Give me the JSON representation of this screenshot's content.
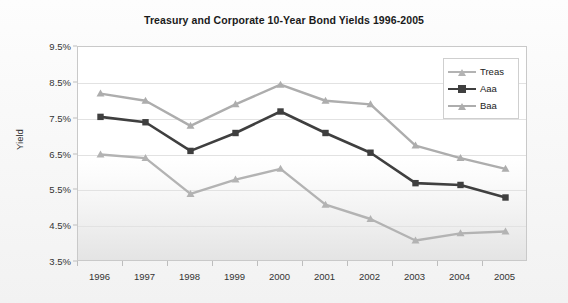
{
  "chart_data": {
    "type": "line",
    "title": "Treasury and Corporate 10-Year Bond Yields 1996-2005",
    "xlabel": "",
    "ylabel": "Yield",
    "categories": [
      "1996",
      "1997",
      "1998",
      "1999",
      "2000",
      "2001",
      "2002",
      "2003",
      "2004",
      "2005"
    ],
    "ylim": [
      3.5,
      9.5
    ],
    "ytick_labels": [
      "9.5%",
      "8.5%",
      "7.5%",
      "6.5%",
      "5.5%",
      "4.5%",
      "3.5%"
    ],
    "ytick_values": [
      9.5,
      8.5,
      7.5,
      6.5,
      5.5,
      4.5,
      3.5
    ],
    "grid": true,
    "legend_position": "top-right",
    "series": [
      {
        "name": "Treas",
        "color": "#b3b3b3",
        "marker": "triangle",
        "values": [
          6.5,
          6.4,
          5.4,
          5.8,
          6.1,
          5.1,
          4.7,
          4.1,
          4.3,
          4.35
        ]
      },
      {
        "name": "Aaa",
        "color": "#3f3f3f",
        "marker": "square",
        "values": [
          7.55,
          7.4,
          6.6,
          7.1,
          7.7,
          7.1,
          6.55,
          5.7,
          5.65,
          5.3
        ]
      },
      {
        "name": "Baa",
        "color": "#adadad",
        "marker": "triangle",
        "values": [
          8.2,
          8.0,
          7.3,
          7.9,
          8.45,
          8.0,
          7.9,
          6.75,
          6.4,
          6.1
        ]
      }
    ]
  },
  "colors": {
    "plot_border": "#c9c9c9",
    "gridline": "#e2e2e2",
    "text": "#333333",
    "title_text": "#1a1a1a",
    "background": "#f7f7f7",
    "legend_border": "#cfcfcf"
  }
}
